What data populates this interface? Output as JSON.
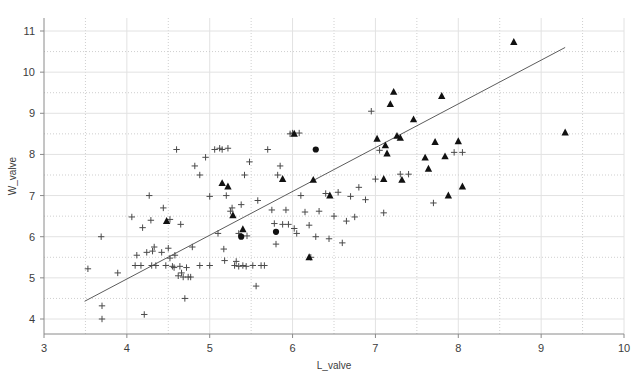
{
  "chart_data": {
    "type": "scatter",
    "title": "",
    "xlabel": "L_valve",
    "ylabel": "W_valve",
    "xlim": [
      3,
      10
    ],
    "ylim": [
      3.6,
      11.35
    ],
    "xticks": [
      3,
      4,
      5,
      6,
      7,
      8,
      9,
      10
    ],
    "yticks": [
      4,
      5,
      6,
      7,
      8,
      9,
      10,
      11
    ],
    "xtick_labels": [
      "3",
      "4",
      "5",
      "6",
      "7",
      "8",
      "9",
      "10"
    ],
    "ytick_labels": [
      "4",
      "5",
      "6",
      "7",
      "8",
      "9",
      "10",
      "11"
    ],
    "grid": true,
    "legend": "none",
    "fit_line": {
      "name": "regression line",
      "x0": 3.49,
      "y0": 4.43,
      "x1": 9.29,
      "y1": 10.6,
      "slope": 1.064,
      "intercept": 0.716,
      "color": "#5c5c5c"
    },
    "series": [
      {
        "name": "plus-markers",
        "marker": "plus",
        "color": "#4a4a4a",
        "points": [
          [
            3.53,
            5.22
          ],
          [
            3.69,
            6.0
          ],
          [
            3.7,
            4.32
          ],
          [
            3.7,
            4.0
          ],
          [
            3.89,
            5.12
          ],
          [
            4.06,
            6.48
          ],
          [
            4.1,
            5.3
          ],
          [
            4.12,
            5.55
          ],
          [
            4.17,
            5.3
          ],
          [
            4.19,
            6.22
          ],
          [
            4.21,
            4.11
          ],
          [
            4.24,
            5.62
          ],
          [
            4.27,
            7.0
          ],
          [
            4.29,
            6.4
          ],
          [
            4.3,
            5.3
          ],
          [
            4.31,
            5.65
          ],
          [
            4.33,
            5.75
          ],
          [
            4.42,
            5.62
          ],
          [
            4.44,
            6.7
          ],
          [
            4.47,
            5.3
          ],
          [
            4.5,
            5.72
          ],
          [
            4.52,
            5.48
          ],
          [
            4.55,
            5.28
          ],
          [
            4.57,
            5.25
          ],
          [
            4.58,
            5.55
          ],
          [
            4.6,
            8.12
          ],
          [
            4.62,
            5.05
          ],
          [
            4.64,
            5.28
          ],
          [
            4.65,
            6.3
          ],
          [
            4.66,
            5.12
          ],
          [
            4.68,
            5.02
          ],
          [
            4.7,
            4.5
          ],
          [
            4.72,
            5.25
          ],
          [
            4.74,
            5.02
          ],
          [
            4.77,
            5.02
          ],
          [
            4.79,
            5.75
          ],
          [
            4.82,
            7.72
          ],
          [
            4.88,
            5.3
          ],
          [
            4.95,
            7.93
          ],
          [
            5.0,
            5.3
          ],
          [
            5.06,
            8.12
          ],
          [
            5.1,
            6.08
          ],
          [
            5.12,
            8.15
          ],
          [
            5.15,
            8.12
          ],
          [
            5.17,
            5.7
          ],
          [
            5.18,
            5.42
          ],
          [
            5.2,
            7.0
          ],
          [
            5.22,
            8.15
          ],
          [
            5.25,
            6.62
          ],
          [
            5.27,
            6.7
          ],
          [
            5.3,
            5.3
          ],
          [
            5.32,
            5.4
          ],
          [
            5.35,
            5.28
          ],
          [
            5.38,
            6.78
          ],
          [
            5.4,
            5.3
          ],
          [
            5.42,
            7.5
          ],
          [
            5.44,
            5.28
          ],
          [
            5.48,
            7.82
          ],
          [
            5.52,
            5.3
          ],
          [
            5.56,
            4.8
          ],
          [
            5.58,
            6.88
          ],
          [
            5.62,
            5.3
          ],
          [
            5.66,
            5.3
          ],
          [
            5.7,
            8.12
          ],
          [
            5.75,
            6.65
          ],
          [
            5.78,
            6.32
          ],
          [
            5.8,
            5.82
          ],
          [
            5.82,
            7.5
          ],
          [
            5.85,
            7.72
          ],
          [
            5.88,
            6.3
          ],
          [
            5.92,
            6.65
          ],
          [
            5.95,
            6.3
          ],
          [
            5.97,
            8.5
          ],
          [
            6.0,
            8.52
          ],
          [
            6.02,
            6.2
          ],
          [
            6.05,
            6.08
          ],
          [
            6.08,
            8.52
          ],
          [
            6.1,
            7.0
          ],
          [
            6.15,
            6.6
          ],
          [
            6.2,
            6.28
          ],
          [
            6.22,
            5.5
          ],
          [
            6.28,
            6.0
          ],
          [
            6.32,
            6.62
          ],
          [
            6.4,
            7.05
          ],
          [
            6.44,
            5.95
          ],
          [
            6.5,
            6.5
          ],
          [
            6.55,
            7.08
          ],
          [
            6.6,
            5.85
          ],
          [
            6.65,
            6.38
          ],
          [
            6.7,
            6.98
          ],
          [
            6.75,
            6.48
          ],
          [
            6.8,
            7.2
          ],
          [
            6.88,
            6.9
          ],
          [
            6.95,
            9.05
          ],
          [
            7.0,
            7.4
          ],
          [
            7.05,
            8.1
          ],
          [
            7.1,
            6.58
          ],
          [
            7.3,
            7.52
          ],
          [
            7.4,
            7.52
          ],
          [
            7.7,
            6.82
          ],
          [
            7.95,
            8.05
          ],
          [
            8.05,
            8.05
          ],
          [
            4.88,
            7.5
          ],
          [
            5.0,
            6.98
          ],
          [
            5.35,
            6.08
          ],
          [
            4.52,
            6.42
          ],
          [
            4.35,
            5.3
          ],
          [
            5.45,
            6.02
          ]
        ]
      },
      {
        "name": "triangle-markers",
        "marker": "triangle",
        "color": "#111111",
        "points": [
          [
            4.48,
            6.38
          ],
          [
            5.28,
            6.52
          ],
          [
            5.15,
            7.3
          ],
          [
            5.22,
            7.22
          ],
          [
            5.4,
            6.18
          ],
          [
            6.02,
            8.5
          ],
          [
            6.2,
            5.5
          ],
          [
            6.45,
            7.0
          ],
          [
            7.02,
            8.38
          ],
          [
            7.1,
            7.4
          ],
          [
            7.12,
            8.22
          ],
          [
            7.14,
            8.02
          ],
          [
            7.18,
            9.22
          ],
          [
            7.22,
            9.52
          ],
          [
            7.26,
            8.45
          ],
          [
            7.3,
            8.4
          ],
          [
            7.32,
            7.38
          ],
          [
            7.46,
            8.85
          ],
          [
            7.6,
            7.92
          ],
          [
            7.64,
            7.65
          ],
          [
            7.72,
            8.3
          ],
          [
            7.8,
            9.42
          ],
          [
            7.84,
            7.95
          ],
          [
            7.88,
            7.0
          ],
          [
            8.0,
            8.32
          ],
          [
            8.05,
            7.22
          ],
          [
            8.67,
            10.73
          ],
          [
            9.29,
            8.53
          ],
          [
            6.25,
            7.38
          ],
          [
            5.88,
            7.4
          ]
        ]
      },
      {
        "name": "circle-markers",
        "marker": "circle",
        "color": "#111111",
        "points": [
          [
            5.38,
            6.0
          ],
          [
            5.8,
            6.12
          ],
          [
            6.28,
            8.12
          ]
        ]
      }
    ]
  },
  "axes": {
    "x_title": "L_valve",
    "y_title": "W_valve"
  }
}
